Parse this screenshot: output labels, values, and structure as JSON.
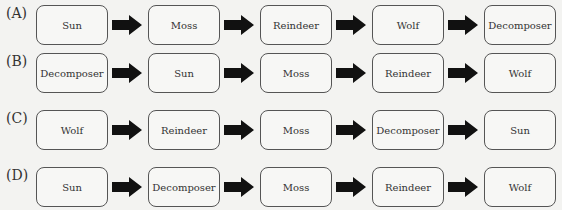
{
  "options": [
    {
      "label": "(A)",
      "chain": [
        "Sun",
        "Moss",
        "Reindeer",
        "Wolf",
        "Decomposer"
      ]
    },
    {
      "label": "(B)",
      "chain": [
        "Decomposer",
        "Sun",
        "Moss",
        "Reindeer",
        "Wolf"
      ]
    },
    {
      "label": "(C)",
      "chain": [
        "Wolf",
        "Reindeer",
        "Moss",
        "Decomposer",
        "Sun"
      ]
    },
    {
      "label": "(D)",
      "chain": [
        "Sun",
        "Decomposer",
        "Moss",
        "Reindeer",
        "Wolf"
      ]
    }
  ],
  "arrow_icon": "right-arrow-icon"
}
